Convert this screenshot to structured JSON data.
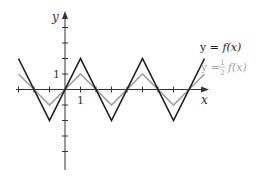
{
  "chart_data": {
    "type": "line",
    "title": "",
    "xlabel": "x",
    "ylabel": "y",
    "xlim": [
      -3,
      9
    ],
    "ylim": [
      -5,
      5
    ],
    "grid": false,
    "x_tick_label": "1",
    "y_tick_label": "1",
    "x_ticks": [
      -3,
      -2,
      -1,
      1,
      2,
      3,
      4,
      5,
      6,
      7
    ],
    "y_ticks": [
      -4,
      -3,
      -2,
      -1,
      1,
      2,
      3,
      4
    ],
    "series": [
      {
        "name": "y = f(x)",
        "color": "#1a1a1a",
        "x": [
          -3,
          -1,
          1,
          3,
          5,
          7,
          9
        ],
        "y": [
          2,
          -2,
          2,
          -2,
          2,
          -2,
          2
        ]
      },
      {
        "name": "y = 1/2 f(x)",
        "color": "#a0a0a0",
        "x": [
          -3,
          -1,
          1,
          3,
          5,
          7,
          9
        ],
        "y": [
          1,
          -1,
          1,
          -1,
          1,
          -1,
          1
        ]
      }
    ],
    "legend": {
      "position": "right",
      "entries": [
        {
          "prefix": "y = ",
          "func": "f(x)",
          "color": "#1a1a1a"
        },
        {
          "prefix": "y = ",
          "numerator": "1",
          "denominator": "2",
          "func": "f(x)",
          "color": "#a0a0a0"
        }
      ]
    }
  },
  "labels": {
    "x_axis": "x",
    "y_axis": "y",
    "x_one": "1",
    "y_one": "1",
    "legend1_prefix": "y = ",
    "legend1_func": "f(x)",
    "legend2_prefix": "y = ",
    "legend2_num": "1",
    "legend2_den": "2",
    "legend2_func": "f(x)"
  }
}
